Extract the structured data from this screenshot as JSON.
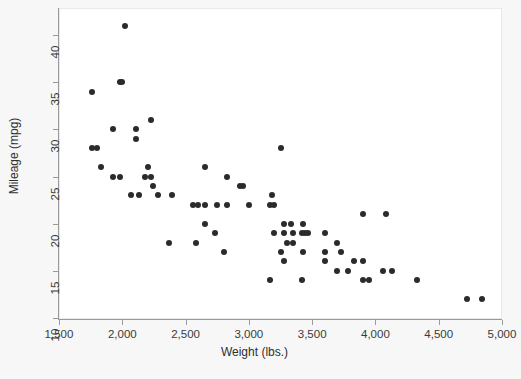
{
  "chart_data": {
    "type": "scatter",
    "title": "",
    "xlabel": "Weight (lbs.)",
    "ylabel": "Mileage (mpg)",
    "xlim": [
      1500,
      5000
    ],
    "ylim": [
      10,
      41
    ],
    "xticks": [
      1500,
      2000,
      2500,
      3000,
      3500,
      4000,
      4500,
      5000
    ],
    "xtick_labels": [
      "1,500",
      "2,000",
      "2,500",
      "3,000",
      "3,500",
      "4,000",
      "4,500",
      "5,000"
    ],
    "yticks": [
      10,
      15,
      20,
      25,
      30,
      35,
      40
    ],
    "ytick_labels": [
      "10",
      "15",
      "20",
      "25",
      "30",
      "35",
      "40"
    ],
    "grid": false,
    "legend": false,
    "marker_color": "#2b2b2b",
    "marker_size": 6,
    "points": [
      {
        "x": 2020,
        "y": 41
      },
      {
        "x": 1980,
        "y": 35
      },
      {
        "x": 2000,
        "y": 35
      },
      {
        "x": 1760,
        "y": 34
      },
      {
        "x": 2230,
        "y": 31
      },
      {
        "x": 1930,
        "y": 30
      },
      {
        "x": 2110,
        "y": 30
      },
      {
        "x": 2110,
        "y": 29
      },
      {
        "x": 1760,
        "y": 28
      },
      {
        "x": 1800,
        "y": 28
      },
      {
        "x": 3250,
        "y": 28
      },
      {
        "x": 1830,
        "y": 26
      },
      {
        "x": 2200,
        "y": 26
      },
      {
        "x": 2650,
        "y": 26
      },
      {
        "x": 1930,
        "y": 25
      },
      {
        "x": 1980,
        "y": 25
      },
      {
        "x": 2180,
        "y": 25
      },
      {
        "x": 2230,
        "y": 25
      },
      {
        "x": 2830,
        "y": 25
      },
      {
        "x": 2240,
        "y": 24
      },
      {
        "x": 2930,
        "y": 24
      },
      {
        "x": 2950,
        "y": 24
      },
      {
        "x": 2070,
        "y": 23
      },
      {
        "x": 2130,
        "y": 23
      },
      {
        "x": 2280,
        "y": 23
      },
      {
        "x": 2390,
        "y": 23
      },
      {
        "x": 3180,
        "y": 23
      },
      {
        "x": 2560,
        "y": 22
      },
      {
        "x": 2600,
        "y": 22
      },
      {
        "x": 2650,
        "y": 22
      },
      {
        "x": 2750,
        "y": 22
      },
      {
        "x": 2830,
        "y": 22
      },
      {
        "x": 3000,
        "y": 22
      },
      {
        "x": 3170,
        "y": 22
      },
      {
        "x": 3200,
        "y": 22
      },
      {
        "x": 3900,
        "y": 21
      },
      {
        "x": 4080,
        "y": 21
      },
      {
        "x": 2650,
        "y": 20
      },
      {
        "x": 3280,
        "y": 20
      },
      {
        "x": 3330,
        "y": 20
      },
      {
        "x": 3430,
        "y": 20
      },
      {
        "x": 2730,
        "y": 19
      },
      {
        "x": 3200,
        "y": 19
      },
      {
        "x": 3280,
        "y": 19
      },
      {
        "x": 3350,
        "y": 19
      },
      {
        "x": 3420,
        "y": 19
      },
      {
        "x": 3440,
        "y": 19
      },
      {
        "x": 3470,
        "y": 19
      },
      {
        "x": 3600,
        "y": 19
      },
      {
        "x": 2580,
        "y": 18
      },
      {
        "x": 3300,
        "y": 18
      },
      {
        "x": 3350,
        "y": 18
      },
      {
        "x": 3700,
        "y": 18
      },
      {
        "x": 2370,
        "y": 18
      },
      {
        "x": 2800,
        "y": 17
      },
      {
        "x": 3250,
        "y": 17
      },
      {
        "x": 3430,
        "y": 17
      },
      {
        "x": 3600,
        "y": 17
      },
      {
        "x": 3730,
        "y": 17
      },
      {
        "x": 3280,
        "y": 16
      },
      {
        "x": 3600,
        "y": 16
      },
      {
        "x": 3830,
        "y": 16
      },
      {
        "x": 3900,
        "y": 16
      },
      {
        "x": 3700,
        "y": 15
      },
      {
        "x": 3780,
        "y": 15
      },
      {
        "x": 4060,
        "y": 15
      },
      {
        "x": 4130,
        "y": 15
      },
      {
        "x": 3170,
        "y": 14
      },
      {
        "x": 3420,
        "y": 14
      },
      {
        "x": 3900,
        "y": 14
      },
      {
        "x": 3950,
        "y": 14
      },
      {
        "x": 4330,
        "y": 14
      },
      {
        "x": 4720,
        "y": 12
      },
      {
        "x": 4840,
        "y": 12
      }
    ]
  }
}
